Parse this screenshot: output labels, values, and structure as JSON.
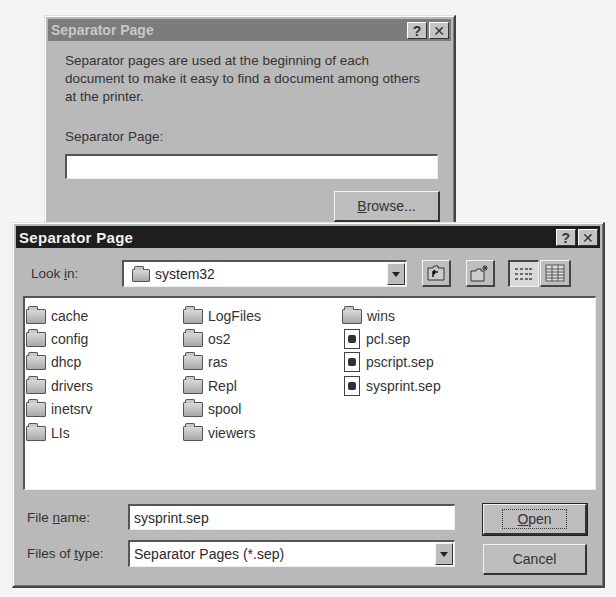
{
  "background_dialog": {
    "title": "Separator Page",
    "help_button": "?",
    "close_button": "✕",
    "description": "Separator pages are used at the beginning of each document to make it easy to find a document among others at the printer.",
    "field_label": "Separator Page:",
    "field_value": "",
    "browse_label": "Browse...",
    "browse_mnemonic": "B"
  },
  "file_dialog": {
    "title": "Separator Page",
    "help_button": "?",
    "close_button": "✕",
    "look_in_label": "Look in:",
    "look_in_value": "system32",
    "toolbar": [
      {
        "name": "up-one-level",
        "icon": "folder-up-icon"
      },
      {
        "name": "create-new-folder",
        "icon": "new-folder-icon"
      },
      {
        "name": "list-view",
        "icon": "list-view-icon",
        "pressed": true
      },
      {
        "name": "details-view",
        "icon": "details-view-icon",
        "pressed": false
      }
    ],
    "items": [
      {
        "name": "cache",
        "type": "folder"
      },
      {
        "name": "config",
        "type": "folder"
      },
      {
        "name": "dhcp",
        "type": "folder"
      },
      {
        "name": "drivers",
        "type": "folder"
      },
      {
        "name": "inetsrv",
        "type": "folder"
      },
      {
        "name": "LIs",
        "type": "folder"
      },
      {
        "name": "LogFiles",
        "type": "folder"
      },
      {
        "name": "os2",
        "type": "folder"
      },
      {
        "name": "ras",
        "type": "folder"
      },
      {
        "name": "Repl",
        "type": "folder"
      },
      {
        "name": "spool",
        "type": "folder"
      },
      {
        "name": "viewers",
        "type": "folder"
      },
      {
        "name": "wins",
        "type": "folder"
      },
      {
        "name": "pcl.sep",
        "type": "file"
      },
      {
        "name": "pscript.sep",
        "type": "file"
      },
      {
        "name": "sysprint.sep",
        "type": "file"
      }
    ],
    "file_name_label": "File name:",
    "file_name_value": "sysprint.sep",
    "file_type_label": "Files of type:",
    "file_type_value": "Separator Pages (*.sep)",
    "open_label": "Open",
    "cancel_label": "Cancel"
  }
}
